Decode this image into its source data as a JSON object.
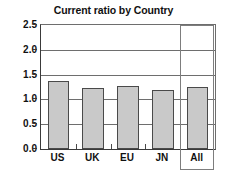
{
  "chart_data": {
    "type": "bar",
    "title": "Current ratio by Country",
    "xlabel": "",
    "ylabel": "",
    "categories": [
      "US",
      "UK",
      "EU",
      "JN",
      "All"
    ],
    "values": [
      1.37,
      1.23,
      1.27,
      1.18,
      1.26
    ],
    "ylim": [
      0.0,
      2.5
    ],
    "ytick_values": [
      0.0,
      0.5,
      1.0,
      1.5,
      2.0,
      2.5
    ],
    "ytick_labels": [
      "0.0",
      "0.5",
      "1.0",
      "1.5",
      "2.0",
      "2.5"
    ],
    "grid": true,
    "grid_axis": "y",
    "legend": false,
    "legend_position": "none",
    "bar_fill_color": "#c9c9c9",
    "bar_edge_color": "#4a4a4a",
    "gridline_color": "#6e6e6e",
    "axis_color": "#3a3a3a",
    "text_color": "#111111",
    "highlight": {
      "category": "All",
      "border_color": "#7d7d7d",
      "label": "All"
    }
  }
}
